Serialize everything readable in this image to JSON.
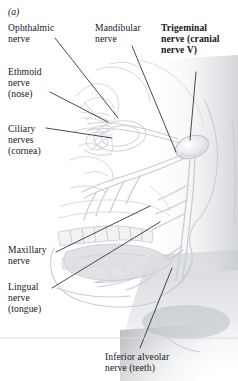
{
  "figure": {
    "panel_id": "(a)",
    "background_color": "#ffffff",
    "text_color": "#17161a",
    "leader_line_color": "#2b2b2f",
    "anatomy_line_color": "#c9ccd2",
    "shading_color": "#b9bcc2"
  },
  "labels": {
    "ophthalmic": "Ophthalmic\nnerve",
    "ethmoid": "Ethmoid\nnerve\n(nose)",
    "ciliary": "Ciliary\nnerves\n(cornea)",
    "mandibular": "Mandibular\nnerve",
    "trigeminal": "Trigeminal\nnerve (cranial\nnerve V)",
    "maxillary": "Maxillary\nnerve",
    "lingual": "Lingual\nnerve\n(tongue)",
    "inferior_alveolar": "Inferior alveolar\nnerve (teeth)"
  },
  "anatomy_parts": [
    "trigeminal-ganglion",
    "ophthalmic-branch",
    "maxillary-branch",
    "mandibular-branch",
    "ciliary-nerves",
    "ethmoid-nerve",
    "lingual-nerve",
    "inferior-alveolar-nerve",
    "upper-teeth-row",
    "lower-teeth-row",
    "tongue",
    "mandible",
    "nasal-cavity",
    "face-profile"
  ]
}
